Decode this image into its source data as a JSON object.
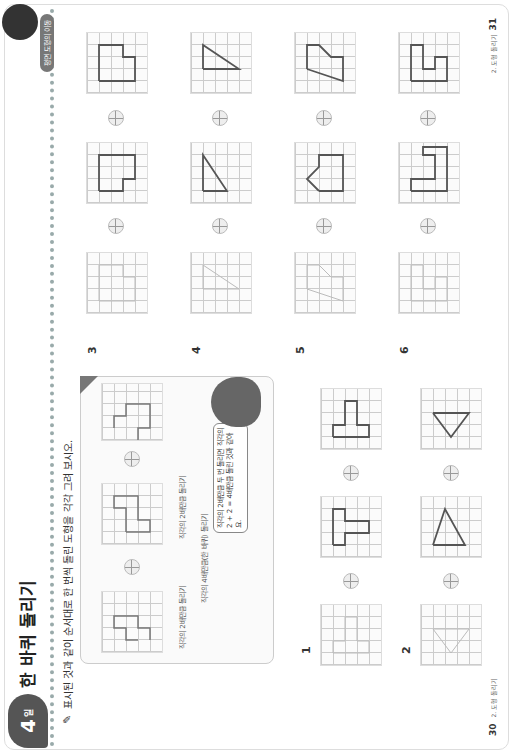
{
  "header": {
    "lesson_number": "4",
    "lesson_suffix": "일",
    "title": "한 바퀴 돌리기",
    "right_tag": "평면 도형의 이동",
    "instruction": "표시된 것과 같이 순서대로 한 번씩 돌린 도형을 각각 그려 보시오."
  },
  "example": {
    "label_step1": "직각의 2배만큼 돌리기",
    "label_step2": "직각의 2배만큼 돌리기",
    "label_total": "직각의 4배만큼(한 바퀴) 돌리기",
    "bubble_text": "직각의 2배만큼 두 번 돌리면 직각의 2 + 2 = 4배만큼 돌린 것과 같아요."
  },
  "problems": [
    {
      "number": "1"
    },
    {
      "number": "2"
    },
    {
      "number": "3"
    },
    {
      "number": "4"
    },
    {
      "number": "5"
    },
    {
      "number": "6"
    }
  ],
  "footer": {
    "left_page": "30",
    "left_label": "2. 도형 돌리기",
    "right_page": "31",
    "right_label": "2. 도형 돌리기"
  },
  "icons": {
    "pencil": "✎",
    "rotation_dial": "rotation-dial"
  }
}
